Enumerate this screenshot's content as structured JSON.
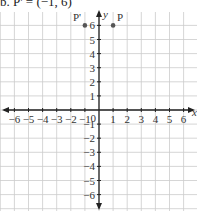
{
  "header": {
    "text": "b. P' = (−1, 6)"
  },
  "chart_data": {
    "type": "scatter",
    "title": "",
    "xlabel": "x",
    "ylabel": "y",
    "xlim": [
      -6,
      6
    ],
    "ylim": [
      -6,
      6
    ],
    "grid": true,
    "x_ticks": [
      "−6",
      "−5",
      "−4",
      "−3",
      "−2",
      "−1",
      "0",
      "1",
      "2",
      "3",
      "4",
      "5",
      "6"
    ],
    "y_ticks": [
      "6",
      "5",
      "4",
      "3",
      "2",
      "1",
      "−1",
      "−2",
      "−3",
      "−4",
      "−5",
      "−6"
    ],
    "points": [
      {
        "label": "P",
        "x": 1,
        "y": 6
      },
      {
        "label": "P'",
        "x": -1,
        "y": 6
      }
    ]
  }
}
